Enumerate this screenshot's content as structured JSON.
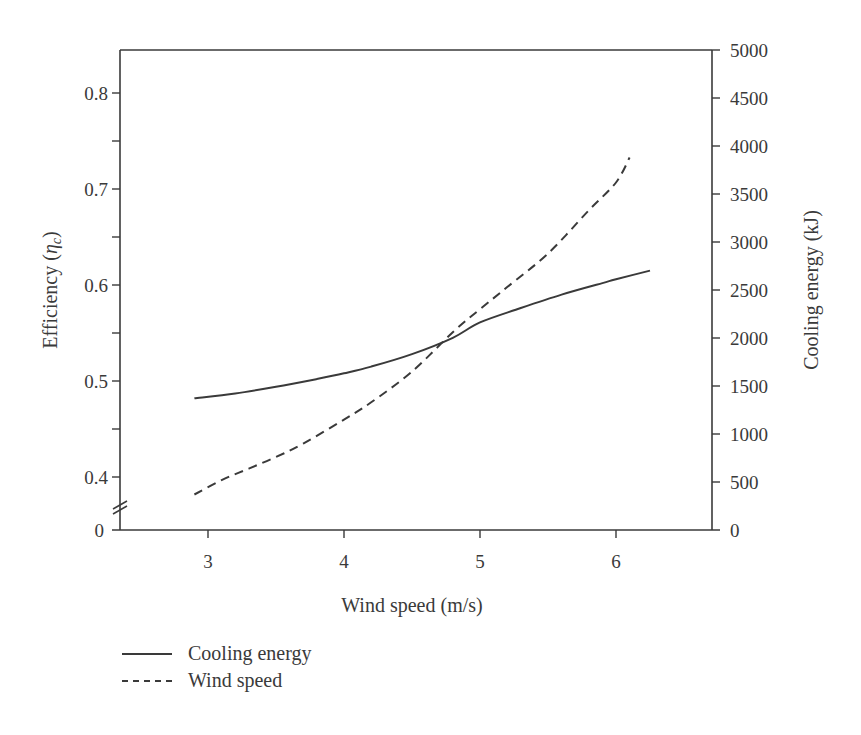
{
  "chart_data": {
    "type": "line",
    "title": "",
    "xlabel": "Wind speed (m/s)",
    "ylabel": "Efficiency (ηc)",
    "ylabel_right": "Cooling energy (kJ)",
    "xlim": [
      2.4,
      6.7
    ],
    "ylim": [
      0,
      0.85
    ],
    "ylim_note": "left axis broken between 0 and ~0.37",
    "ylim_right": [
      0,
      5000
    ],
    "x_ticks": [
      3,
      4,
      5,
      6
    ],
    "y_ticks": [
      0,
      0.4,
      0.5,
      0.6,
      0.7,
      0.8
    ],
    "y_ticks_right": [
      0,
      500,
      1000,
      1500,
      2000,
      2500,
      3000,
      3500,
      4000,
      4500,
      5000
    ],
    "grid": false,
    "legend_position": "below-left",
    "series": [
      {
        "name": "Cooling energy",
        "style": "solid",
        "axis": "left",
        "x": [
          2.9,
          3.2,
          3.5,
          3.8,
          4.0,
          4.2,
          4.5,
          4.8,
          5.0,
          5.3,
          5.6,
          5.9,
          6.0,
          6.25
        ],
        "values": [
          0.482,
          0.487,
          0.494,
          0.502,
          0.508,
          0.515,
          0.528,
          0.545,
          0.561,
          0.576,
          0.59,
          0.602,
          0.606,
          0.615
        ]
      },
      {
        "name": "Wind speed",
        "style": "dashed",
        "axis": "right",
        "x": [
          2.9,
          3.1,
          3.3,
          3.5,
          3.7,
          4.0,
          4.2,
          4.5,
          4.8,
          5.0,
          5.2,
          5.5,
          5.8,
          6.0,
          6.1
        ],
        "values": [
          370,
          520,
          640,
          760,
          900,
          1150,
          1330,
          1650,
          2060,
          2300,
          2530,
          2880,
          3330,
          3620,
          3880
        ]
      }
    ]
  },
  "legend": {
    "items": [
      {
        "label": "Cooling energy",
        "style": "solid"
      },
      {
        "label": "Wind speed",
        "style": "dashed"
      }
    ]
  },
  "axes": {
    "x_title": "Wind speed (m/s)",
    "y_left_title_main": "Efficiency (",
    "y_left_title_symbol": "η",
    "y_left_title_sub": "c",
    "y_left_title_close": ")",
    "y_right_title": "Cooling energy (kJ)",
    "x_tick_labels": [
      "3",
      "4",
      "5",
      "6"
    ],
    "y_left_tick_labels": [
      "0.8",
      "0.7",
      "0.6",
      "0.5",
      "0.4",
      "0"
    ],
    "y_right_tick_labels": [
      "5000",
      "4500",
      "4000",
      "3500",
      "3000",
      "2500",
      "2000",
      "1500",
      "1000",
      "500",
      "0"
    ]
  },
  "colors": {
    "ink": "#3a3a3a",
    "background": "#ffffff"
  }
}
